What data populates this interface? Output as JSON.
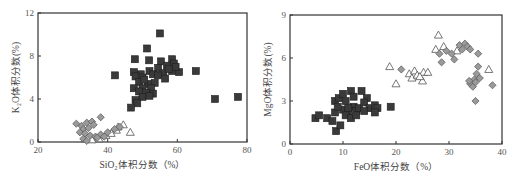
{
  "chart_data": [
    {
      "type": "scatter",
      "title": "",
      "xlabel": "SiO₂体积分数（%）",
      "ylabel": "K₂O体积分数(%)",
      "xlim": [
        20,
        80
      ],
      "ylim": [
        0,
        12
      ],
      "xticks": [
        20,
        40,
        60,
        80
      ],
      "yticks": [
        0,
        4,
        8,
        12
      ],
      "grid": false,
      "legend": "none",
      "series": [
        {
          "name": "square",
          "marker": "square",
          "color": "#3a3a3a",
          "points": [
            [
              55.0,
              10.1
            ],
            [
              51.3,
              8.7
            ],
            [
              47.8,
              7.7
            ],
            [
              51.9,
              7.6
            ],
            [
              55.3,
              7.5
            ],
            [
              58.5,
              7.7
            ],
            [
              59.0,
              7.3
            ],
            [
              57.0,
              7.1
            ],
            [
              54.5,
              6.9
            ],
            [
              52.0,
              6.6
            ],
            [
              49.5,
              6.3
            ],
            [
              47.5,
              6.5
            ],
            [
              48.0,
              6.1
            ],
            [
              50.0,
              6.0
            ],
            [
              53.0,
              6.3
            ],
            [
              56.0,
              6.4
            ],
            [
              58.5,
              6.6
            ],
            [
              60.5,
              6.5
            ],
            [
              59.5,
              7.0
            ],
            [
              56.5,
              5.9
            ],
            [
              53.5,
              5.5
            ],
            [
              51.5,
              5.4
            ],
            [
              49.0,
              5.6
            ],
            [
              47.5,
              5.0
            ],
            [
              50.0,
              5.0
            ],
            [
              52.5,
              5.0
            ],
            [
              49.0,
              4.7
            ],
            [
              51.0,
              4.6
            ],
            [
              53.0,
              4.5
            ],
            [
              50.0,
              4.2
            ],
            [
              52.0,
              4.3
            ],
            [
              48.0,
              3.9
            ],
            [
              48.5,
              3.6
            ],
            [
              46.7,
              3.2
            ],
            [
              42.1,
              6.2
            ],
            [
              65.3,
              6.6
            ],
            [
              70.8,
              4.0
            ],
            [
              77.4,
              4.2
            ],
            [
              50.5,
              5.8
            ],
            [
              54.5,
              6.2
            ],
            [
              57.5,
              6.8
            ]
          ]
        },
        {
          "name": "diamond",
          "marker": "diamond",
          "color": "#9a9a9a",
          "points": [
            [
              31.0,
              1.7
            ],
            [
              32.5,
              1.5
            ],
            [
              34.0,
              1.8
            ],
            [
              35.5,
              1.9
            ],
            [
              38.0,
              2.3
            ],
            [
              33.0,
              1.2
            ],
            [
              34.5,
              1.3
            ],
            [
              36.0,
              1.6
            ],
            [
              32.0,
              0.9
            ],
            [
              33.5,
              0.8
            ],
            [
              35.0,
              0.6
            ],
            [
              36.5,
              0.5
            ],
            [
              33.0,
              0.3
            ],
            [
              34.0,
              0.1
            ],
            [
              38.0,
              0.7
            ],
            [
              40.0,
              0.9
            ],
            [
              42.0,
              1.2
            ],
            [
              43.5,
              1.4
            ],
            [
              37.0,
              0.4
            ],
            [
              39.0,
              0.5
            ]
          ]
        },
        {
          "name": "triangle",
          "marker": "triangle",
          "color": "#ffffff",
          "points": [
            [
              44.5,
              1.6
            ],
            [
              46.5,
              0.9
            ],
            [
              42.5,
              1.1
            ],
            [
              41.0,
              0.8
            ],
            [
              39.5,
              0.6
            ],
            [
              37.5,
              0.3
            ],
            [
              35.5,
              0.2
            ],
            [
              33.5,
              0.3
            ],
            [
              43.0,
              1.4
            ]
          ]
        }
      ]
    },
    {
      "type": "scatter",
      "title": "",
      "xlabel": "FeO体积分数（%）",
      "ylabel": "MgO体积分数(%)",
      "xlim": [
        0,
        40
      ],
      "ylim": [
        0,
        9
      ],
      "xticks": [
        0,
        10,
        20,
        30,
        40
      ],
      "yticks": [
        0,
        3,
        6,
        9
      ],
      "grid": false,
      "legend": "none",
      "series": [
        {
          "name": "square",
          "marker": "square",
          "color": "#3a3a3a",
          "points": [
            [
              4.8,
              1.8
            ],
            [
              5.5,
              2.0
            ],
            [
              7.0,
              1.8
            ],
            [
              8.0,
              1.6
            ],
            [
              8.5,
              2.2
            ],
            [
              8.7,
              0.9
            ],
            [
              9.5,
              1.3
            ],
            [
              8.5,
              3.0
            ],
            [
              9.2,
              3.2
            ],
            [
              10.0,
              3.5
            ],
            [
              10.5,
              3.0
            ],
            [
              11.5,
              3.7
            ],
            [
              12.0,
              3.3
            ],
            [
              13.5,
              3.7
            ],
            [
              14.5,
              3.2
            ],
            [
              10.0,
              2.4
            ],
            [
              11.0,
              2.2
            ],
            [
              12.0,
              2.6
            ],
            [
              12.5,
              2.3
            ],
            [
              13.0,
              2.5
            ],
            [
              14.0,
              2.9
            ],
            [
              15.0,
              2.5
            ],
            [
              16.0,
              2.7
            ],
            [
              16.5,
              2.5
            ],
            [
              10.5,
              2.0
            ],
            [
              11.5,
              1.8
            ],
            [
              12.5,
              2.0
            ],
            [
              14.0,
              2.3
            ],
            [
              16.0,
              2.2
            ],
            [
              19.0,
              2.6
            ],
            [
              9.0,
              2.6
            ],
            [
              11.0,
              2.5
            ]
          ]
        },
        {
          "name": "diamond",
          "marker": "diamond",
          "color": "#9a9a9a",
          "points": [
            [
              21.0,
              5.2
            ],
            [
              28.2,
              6.3
            ],
            [
              28.6,
              5.7
            ],
            [
              29.5,
              6.5
            ],
            [
              30.5,
              6.3
            ],
            [
              31.0,
              5.9
            ],
            [
              32.0,
              6.9
            ],
            [
              32.5,
              6.6
            ],
            [
              33.0,
              7.0
            ],
            [
              33.5,
              6.8
            ],
            [
              34.0,
              6.6
            ],
            [
              35.5,
              6.3
            ],
            [
              34.0,
              4.2
            ],
            [
              34.5,
              4.0
            ],
            [
              34.8,
              4.5
            ],
            [
              35.0,
              4.3
            ],
            [
              35.2,
              4.9
            ],
            [
              35.5,
              5.4
            ],
            [
              35.8,
              4.6
            ],
            [
              35.0,
              3.0
            ],
            [
              38.2,
              4.1
            ],
            [
              33.8,
              4.4
            ]
          ]
        },
        {
          "name": "triangle",
          "marker": "triangle",
          "color": "#ffffff",
          "points": [
            [
              18.8,
              5.4
            ],
            [
              20.0,
              4.2
            ],
            [
              22.5,
              4.9
            ],
            [
              23.0,
              4.6
            ],
            [
              23.5,
              5.1
            ],
            [
              24.0,
              4.8
            ],
            [
              25.0,
              4.4
            ],
            [
              25.2,
              5.0
            ],
            [
              26.0,
              5.0
            ],
            [
              28.0,
              7.6
            ],
            [
              27.5,
              6.6
            ],
            [
              29.0,
              6.8
            ],
            [
              31.5,
              6.5
            ],
            [
              37.5,
              5.2
            ],
            [
              24.5,
              4.7
            ]
          ]
        }
      ]
    }
  ],
  "charts": {
    "left": {
      "xlabel": "SiO₂体积分数（%）",
      "ylabel": "K₂O体积分数(%)",
      "xticks": [
        "20",
        "40",
        "60",
        "80"
      ],
      "yticks": [
        "0",
        "4",
        "8",
        "12"
      ]
    },
    "right": {
      "xlabel": "FeO体积分数（%）",
      "ylabel": "MgO体积分数(%)",
      "xticks": [
        "0",
        "10",
        "20",
        "30",
        "40"
      ],
      "yticks": [
        "0",
        "3",
        "6",
        "9"
      ]
    }
  }
}
